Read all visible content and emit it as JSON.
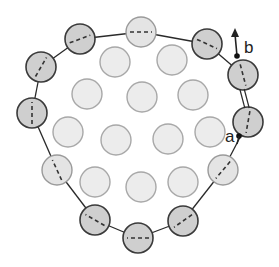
{
  "diagram": {
    "type": "particle-cluster-boundary",
    "labels": {
      "a": "a",
      "b": "b"
    },
    "colors": {
      "boundary_line": "#2a2a2a",
      "boundary_dark_fill": "#cfcfcf",
      "boundary_dark_stroke": "#3a3a3a",
      "boundary_light_fill": "#e4e4e4",
      "boundary_light_stroke": "#9a9a9a",
      "interior_fill": "#ececec",
      "interior_stroke": "#a8a8a8"
    },
    "radius": 15,
    "boundary_circles": [
      {
        "id": "top-left",
        "cx": 80,
        "cy": 39,
        "shade": "dark",
        "dash_angle": -20
      },
      {
        "id": "top-center",
        "cx": 141,
        "cy": 32,
        "shade": "light",
        "dash_angle": 0
      },
      {
        "id": "top-right",
        "cx": 207,
        "cy": 44,
        "shade": "dark",
        "dash_angle": 25
      },
      {
        "id": "right-upper-b",
        "cx": 243,
        "cy": 75,
        "shade": "dark",
        "dash_angle": 75
      },
      {
        "id": "right-lower-a",
        "cx": 248,
        "cy": 122,
        "shade": "dark",
        "dash_angle": 100
      },
      {
        "id": "right-bottom",
        "cx": 223,
        "cy": 170,
        "shade": "light",
        "dash_angle": 130
      },
      {
        "id": "bottom-right",
        "cx": 183,
        "cy": 221,
        "shade": "dark",
        "dash_angle": 145
      },
      {
        "id": "bottom-center",
        "cx": 138,
        "cy": 238,
        "shade": "dark",
        "dash_angle": 180
      },
      {
        "id": "bottom-left",
        "cx": 95,
        "cy": 220,
        "shade": "dark",
        "dash_angle": 210
      },
      {
        "id": "left-lower",
        "cx": 57,
        "cy": 170,
        "shade": "light",
        "dash_angle": 245
      },
      {
        "id": "left",
        "cx": 32,
        "cy": 113,
        "shade": "dark",
        "dash_angle": 270
      },
      {
        "id": "left-upper",
        "cx": 41,
        "cy": 67,
        "shade": "dark",
        "dash_angle": 300
      }
    ],
    "interior_circles": [
      {
        "cx": 115,
        "cy": 62
      },
      {
        "cx": 172,
        "cy": 60
      },
      {
        "cx": 87,
        "cy": 94
      },
      {
        "cx": 142,
        "cy": 97
      },
      {
        "cx": 193,
        "cy": 95
      },
      {
        "cx": 68,
        "cy": 132
      },
      {
        "cx": 116,
        "cy": 140
      },
      {
        "cx": 168,
        "cy": 139
      },
      {
        "cx": 210,
        "cy": 132
      },
      {
        "cx": 95,
        "cy": 182
      },
      {
        "cx": 141,
        "cy": 187
      },
      {
        "cx": 183,
        "cy": 182
      }
    ],
    "point_a": {
      "x": 239,
      "y": 136
    },
    "point_b": {
      "x": 237,
      "y": 56
    },
    "arrow_b": {
      "from_x": 237,
      "from_y": 56,
      "to_x": 235,
      "to_y": 28
    }
  }
}
